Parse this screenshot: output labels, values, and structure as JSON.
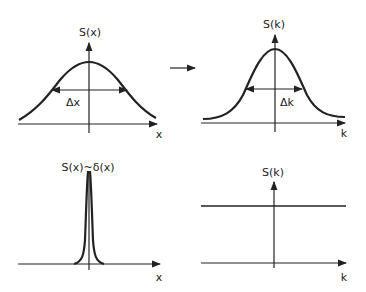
{
  "panels": {
    "top_left": {
      "ylabel": "S(x)",
      "xlabel": "x",
      "width_label": "Δx",
      "description": "broad Gaussian in x"
    },
    "top_right": {
      "ylabel": "S(k)",
      "xlabel": "k",
      "width_label": "Δk",
      "description": "Gaussian in k"
    },
    "bottom_left": {
      "ylabel": "S(x)~δ(x)",
      "xlabel": "x",
      "description": "narrow spike (delta function)"
    },
    "bottom_right": {
      "ylabel": "S(k)",
      "xlabel": "k",
      "description": "constant flat spectrum"
    }
  },
  "transform_arrow": {
    "direction": "right"
  },
  "colors": {
    "ink": "#222222",
    "background": "#ffffff"
  }
}
